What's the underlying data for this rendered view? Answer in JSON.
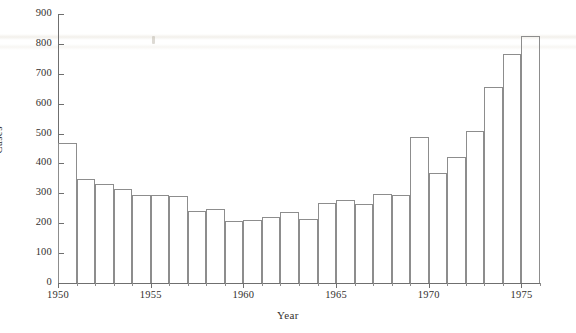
{
  "chart_data": {
    "type": "bar",
    "title": "",
    "xlabel": "Year",
    "ylabel": "Cases",
    "xlim": [
      1950,
      1976
    ],
    "ylim": [
      0,
      900
    ],
    "grid": false,
    "legend": null,
    "y_ticks": [
      0,
      100,
      200,
      300,
      400,
      500,
      600,
      700,
      800,
      900
    ],
    "y_tick_labels": [
      "0",
      "100",
      "200",
      "300",
      "400",
      "500",
      "600",
      "700",
      "800",
      "900"
    ],
    "x_ticks": [
      1950,
      1955,
      1960,
      1965,
      1970,
      1975
    ],
    "x_tick_labels": [
      "1950",
      "1955",
      "1960",
      "1965",
      "1970",
      "1975"
    ],
    "categories": [
      1950,
      1951,
      1952,
      1953,
      1954,
      1955,
      1956,
      1957,
      1958,
      1959,
      1960,
      1961,
      1962,
      1963,
      1964,
      1965,
      1966,
      1967,
      1968,
      1969,
      1970,
      1971,
      1972,
      1973,
      1974,
      1975
    ],
    "values": [
      468,
      347,
      330,
      316,
      293,
      293,
      292,
      241,
      248,
      206,
      211,
      221,
      237,
      215,
      268,
      277,
      264,
      299,
      296,
      489,
      369,
      422,
      508,
      656,
      767,
      827
    ]
  },
  "axis": {
    "y_title": "Cases",
    "x_title": "Year"
  }
}
